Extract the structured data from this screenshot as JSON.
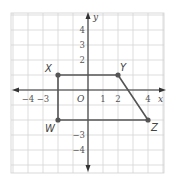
{
  "diagram": {
    "type": "coordinate-plane",
    "grid": {
      "x_range": [
        -5,
        5
      ],
      "y_range": [
        -5,
        5
      ],
      "unit_px": 15,
      "origin_px": [
        88,
        90
      ],
      "line_color": "#d4d4d4"
    },
    "axes": {
      "x_label": "x",
      "y_label": "y",
      "origin_label": "O",
      "color": "#333333"
    },
    "x_ticks": [
      {
        "value": -4,
        "label": "−4"
      },
      {
        "value": -3,
        "label": "−3"
      },
      {
        "value": 1,
        "label": "1"
      },
      {
        "value": 2,
        "label": "2"
      },
      {
        "value": 4,
        "label": "4"
      }
    ],
    "y_ticks": [
      {
        "value": 4,
        "label": "4"
      },
      {
        "value": 3,
        "label": "3"
      },
      {
        "value": 2,
        "label": "2"
      },
      {
        "value": -3,
        "label": "−3"
      },
      {
        "value": -4,
        "label": "−4"
      }
    ],
    "shape": {
      "name": "trapezoid WXYZ",
      "stroke_color": "#555555",
      "vertices": [
        {
          "label": "X",
          "x": -2,
          "y": 1
        },
        {
          "label": "Y",
          "x": 2,
          "y": 1
        },
        {
          "label": "Z",
          "x": 4,
          "y": -2
        },
        {
          "label": "W",
          "x": -2,
          "y": -2
        }
      ]
    }
  }
}
